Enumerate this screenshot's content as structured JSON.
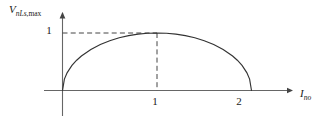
{
  "figure": {
    "name": "vnls-max-vs-ino-curve",
    "background_color": "#ffffff",
    "line_color": "#333333",
    "axis_color": "#555555",
    "dash_color": "#444444"
  },
  "axes": {
    "y": {
      "label_main": "V",
      "label_sub_italic": "nLs",
      "label_sub_upright": ",max",
      "arrow": true,
      "ticks": [
        {
          "value": 1,
          "label": "1"
        }
      ]
    },
    "x": {
      "label_main": "I",
      "label_sub_italic": "no",
      "label_sub_upright": "",
      "arrow": true,
      "ticks": [
        {
          "value": 1,
          "label": "1"
        },
        {
          "value": 2,
          "label": "2"
        }
      ]
    }
  },
  "guides": {
    "horizontal_dashed": {
      "y": 1,
      "from_x": 0,
      "to_x": 1
    },
    "vertical_dashed": {
      "x": 1,
      "from_y": 0,
      "to_y": 1
    }
  },
  "chart_data": {
    "type": "line",
    "title": "",
    "xlabel": "I_no",
    "ylabel": "V_nLs,max",
    "xlim": [
      0,
      2.35
    ],
    "ylim": [
      0,
      1.18
    ],
    "grid": false,
    "legend": null,
    "xticks": [
      1,
      2
    ],
    "xticklabels": [
      "1",
      "2"
    ],
    "yticks": [
      1
    ],
    "yticklabels": [
      "1"
    ],
    "annotations": [
      {
        "text": "peak at (1, 1)",
        "x": 1,
        "y": 1
      }
    ],
    "series": [
      {
        "name": "V_nLs,max",
        "equation": "sqrt(x*(2-x))",
        "x": [
          0,
          0.02,
          0.05,
          0.1,
          0.15,
          0.2,
          0.3,
          0.4,
          0.5,
          0.6,
          0.7,
          0.8,
          0.9,
          1.0,
          1.1,
          1.2,
          1.3,
          1.4,
          1.5,
          1.6,
          1.7,
          1.8,
          1.85,
          1.9,
          1.95,
          1.98,
          2.0
        ],
        "y": [
          0,
          0.199,
          0.312,
          0.436,
          0.527,
          0.6,
          0.714,
          0.8,
          0.866,
          0.917,
          0.954,
          0.98,
          0.995,
          1.0,
          0.995,
          0.98,
          0.954,
          0.917,
          0.866,
          0.8,
          0.714,
          0.6,
          0.527,
          0.436,
          0.312,
          0.199,
          0
        ]
      }
    ]
  }
}
